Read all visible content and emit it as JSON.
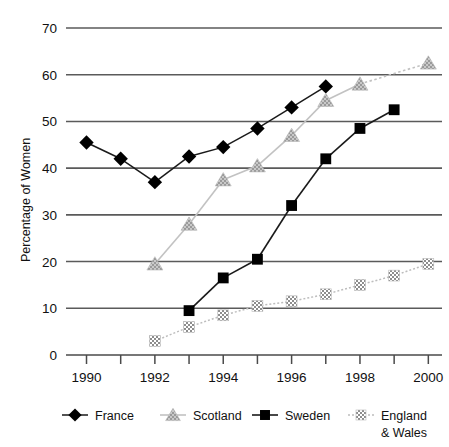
{
  "chart_data": {
    "type": "line",
    "title": "",
    "xlabel": "",
    "ylabel": "Percentage of Women",
    "xlim": [
      1989.4,
      2000.4
    ],
    "ylim": [
      0,
      70
    ],
    "yticks": [
      0,
      10,
      20,
      30,
      40,
      50,
      60,
      70
    ],
    "xticks": [
      1990,
      1991,
      1992,
      1993,
      1994,
      1995,
      1996,
      1997,
      1998,
      1999,
      2000
    ],
    "xtick_labels_shown": [
      "1990",
      "1992",
      "1994",
      "1996",
      "1998",
      "2000"
    ],
    "grid": "horizontal gridlines at 10,20,30,40,50,60,70",
    "legend_position": "bottom",
    "series": [
      {
        "name": "France",
        "marker": "filled-diamond",
        "color": "#000000",
        "line": "solid",
        "x": [
          1990,
          1991,
          1992,
          1993,
          1994,
          1995,
          1996,
          1997
        ],
        "values": [
          45.5,
          42.0,
          37.0,
          42.5,
          44.5,
          48.5,
          53.0,
          57.5
        ]
      },
      {
        "name": "Scotland",
        "marker": "filled-triangle",
        "color": "#a8a8a8",
        "line": "solid-with-dotted-gap",
        "x": [
          1992,
          1993,
          1994,
          1995,
          1996,
          1997,
          1998,
          2000
        ],
        "values": [
          19.5,
          28.0,
          37.5,
          40.5,
          47.0,
          54.5,
          58.0,
          62.5
        ]
      },
      {
        "name": "Sweden",
        "marker": "filled-square",
        "color": "#000000",
        "line": "solid",
        "x": [
          1993,
          1994,
          1995,
          1996,
          1997,
          1998,
          1999
        ],
        "values": [
          9.5,
          16.5,
          20.5,
          32.0,
          42.0,
          48.5,
          52.5
        ]
      },
      {
        "name": "England & Wales",
        "marker": "checkered-square",
        "color": "#a0a0a0",
        "line": "dotted",
        "x": [
          1992,
          1993,
          1994,
          1995,
          1996,
          1997,
          1998,
          1999,
          2000
        ],
        "values": [
          3.0,
          6.0,
          8.5,
          10.5,
          11.5,
          13.0,
          15.0,
          17.0,
          19.5
        ]
      }
    ]
  },
  "axis": {
    "y_title": "Percentage of Women",
    "y_tick_labels": [
      "70",
      "60",
      "50",
      "40",
      "30",
      "20",
      "10",
      "0"
    ],
    "x_tick_labels": [
      "1990",
      "1992",
      "1994",
      "1996",
      "1998",
      "2000"
    ]
  },
  "legend": {
    "items": [
      {
        "label": "France",
        "marker": "filled-diamond",
        "color": "#000000"
      },
      {
        "label": "Scotland",
        "marker": "filled-triangle",
        "color": "#a8a8a8"
      },
      {
        "label": "Sweden",
        "marker": "filled-square",
        "color": "#000000"
      },
      {
        "label": "England",
        "label2": "& Wales",
        "marker": "checkered-square",
        "color": "#a0a0a0"
      }
    ]
  }
}
